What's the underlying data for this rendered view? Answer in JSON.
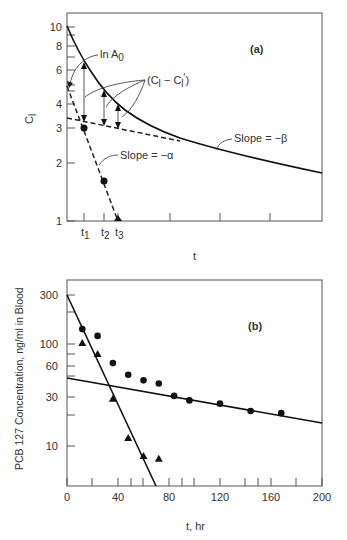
{
  "chart_data": [
    {
      "panel": "(a)",
      "type": "line",
      "title": "",
      "panel_label": "(a)",
      "xlabel": "t",
      "ylabel": "C_l",
      "yscale": "log",
      "ylim": [
        1,
        12
      ],
      "yticks": [
        "1",
        "2",
        "3",
        "4",
        "6",
        "8",
        "10"
      ],
      "xticks": [
        "t1",
        "t2",
        "t3"
      ],
      "grid": false,
      "annotations": [
        "ln A0",
        "(C_l - C_l')",
        "Slope = -β",
        "Slope = -α"
      ],
      "series": [
        {
          "name": "Plasma concentration (biexponential)",
          "style": "solid",
          "x_px": [
            67,
            84,
            104,
            120,
            140,
            175,
            205,
            250,
            322
          ],
          "values": [
            10,
            6.2,
            4.8,
            4.0,
            3.4,
            2.8,
            2.5,
            2.2,
            1.7
          ]
        },
        {
          "name": "Terminal phase extrapolation (slope -β)",
          "style": "dashed",
          "x_px": [
            67,
            205
          ],
          "values": [
            3.4,
            2.5
          ]
        },
        {
          "name": "Residual line (slope -α)",
          "style": "dashed",
          "x_px": [
            67,
            84,
            104,
            118
          ],
          "values": [
            5.0,
            3.0,
            1.6,
            1.0
          ]
        },
        {
          "name": "Residual points",
          "style": "markers",
          "labels": [
            "t1",
            "t2",
            "t3"
          ],
          "values": [
            3.0,
            1.6,
            1.0
          ]
        }
      ]
    },
    {
      "panel": "(b)",
      "type": "scatter",
      "title": "",
      "panel_label": "(b)",
      "xlabel": "t, hr",
      "ylabel": "PCB 127 Concentration, ng/ml in Blood",
      "yscale": "log",
      "xlim": [
        0,
        200
      ],
      "ylim": [
        4,
        420
      ],
      "xticks": [
        "0",
        "40",
        "80",
        "120",
        "160",
        "200"
      ],
      "yticks": [
        "10",
        "30",
        "60",
        "100",
        "300"
      ],
      "grid": false,
      "series": [
        {
          "name": "Observed (circles)",
          "marker": "circle",
          "x": [
            12,
            24,
            36,
            48,
            60,
            72,
            84,
            96,
            120,
            144,
            168
          ],
          "values": [
            140,
            120,
            65,
            50,
            44,
            41,
            31,
            28,
            26,
            22,
            21
          ]
        },
        {
          "name": "Residuals (triangles)",
          "marker": "triangle",
          "x": [
            12,
            24,
            36,
            48,
            60,
            72
          ],
          "values": [
            102,
            80,
            29,
            12,
            8,
            7.5
          ]
        },
        {
          "name": "Fast phase fit",
          "style": "solid-line",
          "x": [
            0,
            70
          ],
          "values": [
            300,
            4
          ]
        },
        {
          "name": "Slow phase fit",
          "style": "solid-line",
          "x": [
            0,
            200
          ],
          "values": [
            46,
            17
          ]
        }
      ]
    }
  ],
  "panel_a": {
    "label": "(a)",
    "ylabel": "C",
    "ylabel_sub": "l",
    "xlabel": "t",
    "yticks": [
      {
        "v": "10",
        "y": 27
      },
      {
        "v": "8",
        "y": 46
      },
      {
        "v": "6",
        "y": 70
      },
      {
        "v": "4",
        "y": 104
      },
      {
        "v": "3",
        "y": 128
      },
      {
        "v": "2",
        "y": 163
      },
      {
        "v": "1",
        "y": 221
      }
    ],
    "xticks": [
      {
        "v": "t",
        "s": "1",
        "x": 84
      },
      {
        "v": "t",
        "s": "2",
        "x": 104
      },
      {
        "v": "t",
        "s": "3",
        "x": 118
      }
    ],
    "ann_lnA0": "ln A",
    "ann_lnA0_sub": "0",
    "ann_diff": "(C",
    "ann_diff_b": " − C",
    "ann_diff_c": ")",
    "ann_beta": "Slope = −β",
    "ann_alpha": "Slope = −α"
  },
  "panel_b": {
    "label": "(b)",
    "ylabel": "PCB 127 Concentration, ng/ml in Blood",
    "xlabel": "t, hr",
    "yticks": [
      {
        "v": "300",
        "y": 295
      },
      {
        "v": "100",
        "y": 344
      },
      {
        "v": "60",
        "y": 366
      },
      {
        "v": "30",
        "y": 397
      },
      {
        "v": "10",
        "y": 446
      }
    ],
    "xticks": [
      {
        "v": "0",
        "x": 67
      },
      {
        "v": "40",
        "x": 118
      },
      {
        "v": "80",
        "x": 169
      },
      {
        "v": "120",
        "x": 220
      },
      {
        "v": "160",
        "x": 271
      },
      {
        "v": "200",
        "x": 322
      }
    ]
  }
}
